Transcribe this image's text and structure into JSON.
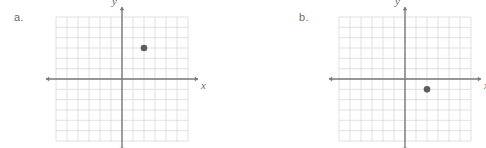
{
  "page": {
    "background_color": "#ffffff",
    "width": 486,
    "height": 148
  },
  "style": {
    "grid_color": "#d9d9dd",
    "axis_color": "#7a7a7a",
    "point_color": "#5e5e5e",
    "label_color": "#6b6b6b",
    "axis_label_color": "#6e6e6e"
  },
  "problems": [
    {
      "id": "a",
      "label": "a.",
      "x_axis_label": "x",
      "y_axis_label": "y",
      "chart_data": {
        "type": "scatter",
        "title": "",
        "xlabel": "x",
        "ylabel": "y",
        "grid": true,
        "legend": "none",
        "xlim": [
          -6,
          6
        ],
        "ylim": [
          -6,
          6
        ],
        "grid_step": 1,
        "x_ticks": [],
        "y_ticks": [],
        "points": [
          {
            "x": 2,
            "y": 3
          }
        ]
      }
    },
    {
      "id": "b",
      "label": "b.",
      "x_axis_label": "x",
      "y_axis_label": "y",
      "chart_data": {
        "type": "scatter",
        "title": "",
        "xlabel": "x",
        "ylabel": "y",
        "grid": true,
        "legend": "none",
        "xlim": [
          -6,
          6
        ],
        "ylim": [
          -6,
          6
        ],
        "grid_step": 1,
        "x_ticks": [],
        "y_ticks": [],
        "points": [
          {
            "x": 2,
            "y": -1
          }
        ]
      }
    }
  ]
}
